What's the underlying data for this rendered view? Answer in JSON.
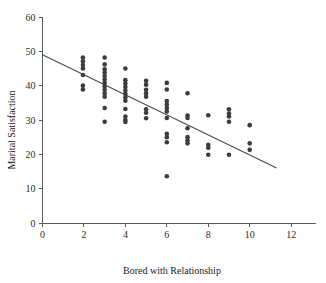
{
  "chart_data": {
    "type": "scatter",
    "title": "",
    "xlabel": "Bored with Relationship",
    "ylabel": "Marital Satisfaction",
    "xlim": [
      0,
      13.2
    ],
    "ylim": [
      0,
      60
    ],
    "xticks": [
      0,
      2,
      4,
      6,
      8,
      10,
      12
    ],
    "yticks": [
      0,
      10,
      20,
      30,
      40,
      50,
      60
    ],
    "xtick_labels": [
      "0",
      "2",
      "4",
      "6",
      "8",
      "10",
      "12"
    ],
    "ytick_labels": [
      "0",
      "10",
      "20",
      "30",
      "40",
      "50",
      "60"
    ],
    "grid": false,
    "legend": null,
    "marker": "filled-circle",
    "marker_color": "#3c3c3c",
    "trend_line": {
      "type": "linear-regression",
      "color": "#4a4a4a",
      "x_start": 0.0,
      "y_start": 49.0,
      "x_end": 11.3,
      "y_end": 16.0
    },
    "points": [
      [
        1.95,
        48.2
      ],
      [
        1.95,
        47.1
      ],
      [
        1.95,
        46.0
      ],
      [
        1.95,
        45.0
      ],
      [
        1.95,
        43.1
      ],
      [
        1.95,
        40.0
      ],
      [
        1.95,
        38.9
      ],
      [
        3.0,
        48.2
      ],
      [
        3.0,
        46.2
      ],
      [
        3.0,
        44.8
      ],
      [
        3.0,
        43.8
      ],
      [
        3.0,
        42.8
      ],
      [
        3.0,
        41.8
      ],
      [
        3.0,
        40.8
      ],
      [
        3.0,
        39.8
      ],
      [
        3.0,
        38.8
      ],
      [
        3.0,
        37.8
      ],
      [
        3.0,
        36.8
      ],
      [
        3.0,
        33.5
      ],
      [
        3.0,
        29.5
      ],
      [
        4.0,
        45.0
      ],
      [
        4.0,
        41.6
      ],
      [
        4.0,
        40.6
      ],
      [
        4.0,
        39.6
      ],
      [
        4.0,
        38.6
      ],
      [
        4.0,
        37.6
      ],
      [
        4.0,
        36.6
      ],
      [
        4.0,
        35.6
      ],
      [
        4.0,
        33.2
      ],
      [
        4.0,
        31.0
      ],
      [
        4.0,
        30.0
      ],
      [
        4.0,
        29.4
      ],
      [
        5.0,
        41.4
      ],
      [
        5.0,
        40.3
      ],
      [
        5.0,
        38.8
      ],
      [
        5.0,
        37.8
      ],
      [
        5.0,
        36.8
      ],
      [
        5.0,
        33.1
      ],
      [
        5.0,
        32.1
      ],
      [
        5.0,
        30.5
      ],
      [
        6.0,
        40.8
      ],
      [
        6.0,
        38.9
      ],
      [
        6.0,
        35.5
      ],
      [
        6.0,
        34.5
      ],
      [
        6.0,
        33.5
      ],
      [
        6.0,
        32.5
      ],
      [
        6.0,
        30.6
      ],
      [
        6.0,
        26.0
      ],
      [
        6.0,
        25.0
      ],
      [
        6.0,
        23.5
      ],
      [
        6.0,
        13.6
      ],
      [
        7.0,
        37.8
      ],
      [
        7.0,
        31.3
      ],
      [
        7.0,
        30.6
      ],
      [
        7.0,
        27.6
      ],
      [
        7.0,
        25.0
      ],
      [
        7.0,
        24.0
      ],
      [
        7.0,
        23.2
      ],
      [
        8.0,
        31.4
      ],
      [
        8.0,
        22.8
      ],
      [
        8.0,
        21.9
      ],
      [
        8.0,
        19.9
      ],
      [
        9.0,
        33.1
      ],
      [
        9.0,
        31.9
      ],
      [
        9.0,
        31.0
      ],
      [
        9.0,
        29.5
      ],
      [
        9.0,
        19.9
      ],
      [
        10.0,
        28.5
      ],
      [
        10.0,
        23.2
      ],
      [
        10.0,
        21.3
      ]
    ]
  }
}
